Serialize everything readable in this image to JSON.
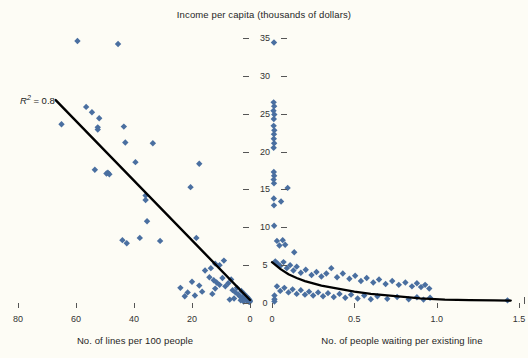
{
  "figure": {
    "title": "Income per capita (thousands of dollars)",
    "width": 528,
    "height": 358,
    "background_color": "#fdfcf5",
    "marker_color": "#4a6fa0",
    "trend_color": "#000000",
    "text_color": "#262626"
  },
  "annotations": {
    "r2_prefix": "R",
    "r2_sup": "2",
    "r2_value": " = 0.8"
  },
  "axis": {
    "shared_y": {
      "label": "Income per capita (thousands of dollars)",
      "ticks": [
        0,
        5,
        10,
        15,
        20,
        25,
        30,
        35
      ],
      "tick_labels": [
        "0",
        "5",
        "10",
        "15",
        "20",
        "25",
        "30",
        "35"
      ],
      "range": [
        0,
        36.5
      ]
    },
    "left_x": {
      "label": "No. of lines per 100 people",
      "ticks": [
        80,
        60,
        40,
        20,
        0
      ],
      "tick_labels": [
        "80",
        "60",
        "40",
        "20",
        "0"
      ],
      "range": [
        82,
        -2
      ],
      "reversed": true
    },
    "right_x": {
      "label": "No. of people waiting per existing line",
      "ticks": [
        0,
        0.5,
        1.0,
        1.5
      ],
      "tick_labels": [
        "0",
        "0.5",
        "1.0",
        "1.5"
      ],
      "range": [
        -0.02,
        1.53
      ]
    }
  },
  "chart_data": [
    {
      "type": "scatter",
      "id": "left-panel",
      "title": "Income per capita (thousands of dollars)",
      "xlabel": "No. of lines per 100 people",
      "ylabel": "Income per capita (thousands of dollars)",
      "xlim": [
        82,
        -2
      ],
      "ylim": [
        0,
        36.5
      ],
      "grid": false,
      "legend": "none",
      "annotation": "R2 = 0.8",
      "series": [
        {
          "name": "countries",
          "marker": "diamond",
          "color": "#4a6fa0",
          "points": [
            [
              59.5,
              34.6
            ],
            [
              45.5,
              34.2
            ],
            [
              56.5,
              25.9
            ],
            [
              54.5,
              25.2
            ],
            [
              52.0,
              24.4
            ],
            [
              52.5,
              23.2
            ],
            [
              52.5,
              22.9
            ],
            [
              65.0,
              23.6
            ],
            [
              43.5,
              23.3
            ],
            [
              43.0,
              21.2
            ],
            [
              33.5,
              21.1
            ],
            [
              39.5,
              18.6
            ],
            [
              53.5,
              17.6
            ],
            [
              49.0,
              17.2
            ],
            [
              49.5,
              17.1
            ],
            [
              48.5,
              17.0
            ],
            [
              17.5,
              18.4
            ],
            [
              20.5,
              15.3
            ],
            [
              36.0,
              14.2
            ],
            [
              36.0,
              13.6
            ],
            [
              35.5,
              10.8
            ],
            [
              44.0,
              8.3
            ],
            [
              42.5,
              7.9
            ],
            [
              38.0,
              8.6
            ],
            [
              31.0,
              8.2
            ],
            [
              18.5,
              8.6
            ],
            [
              24.0,
              2.0
            ],
            [
              21.5,
              1.4
            ],
            [
              15.5,
              4.3
            ],
            [
              13.5,
              4.6
            ],
            [
              12.0,
              5.2
            ],
            [
              10.5,
              5.0
            ],
            [
              9.0,
              5.6
            ],
            [
              14.0,
              3.4
            ],
            [
              12.5,
              3.0
            ],
            [
              11.5,
              2.7
            ],
            [
              10.5,
              2.4
            ],
            [
              9.5,
              3.3
            ],
            [
              8.5,
              2.2
            ],
            [
              7.5,
              2.6
            ],
            [
              6.5,
              3.1
            ],
            [
              6.0,
              1.7
            ],
            [
              5.0,
              1.4
            ],
            [
              4.5,
              2.0
            ],
            [
              4.0,
              1.1
            ],
            [
              3.5,
              0.9
            ],
            [
              3.0,
              1.6
            ],
            [
              2.5,
              0.7
            ],
            [
              2.0,
              1.2
            ],
            [
              1.8,
              0.5
            ],
            [
              1.5,
              0.9
            ],
            [
              1.2,
              0.4
            ],
            [
              1.0,
              0.8
            ],
            [
              0.8,
              0.3
            ],
            [
              0.6,
              0.6
            ],
            [
              0.5,
              0.2
            ],
            [
              0.4,
              0.5
            ],
            [
              0.3,
              0.3
            ],
            [
              0.2,
              0.4
            ],
            [
              0.15,
              0.2
            ],
            [
              0.1,
              0.3
            ],
            [
              0.05,
              0.15
            ],
            [
              2.2,
              0.2
            ],
            [
              3.2,
              0.35
            ],
            [
              5.5,
              0.6
            ],
            [
              7.0,
              0.45
            ],
            [
              12.0,
              1.9
            ],
            [
              13.0,
              1.2
            ],
            [
              16.5,
              1.5
            ],
            [
              17.5,
              2.3
            ],
            [
              19.0,
              1.0
            ],
            [
              20.0,
              2.8
            ],
            [
              22.5,
              0.9
            ]
          ]
        }
      ],
      "trendline": {
        "type": "linear",
        "x_start": 67.0,
        "y_start": 26.8,
        "x_end": 0.0,
        "y_end": 0.4
      }
    },
    {
      "type": "scatter",
      "id": "right-panel",
      "title": "Income per capita (thousands of dollars)",
      "xlabel": "No. of people waiting per existing line",
      "ylabel": "Income per capita (thousands of dollars)",
      "xlim": [
        -0.02,
        1.53
      ],
      "ylim": [
        0,
        36.5
      ],
      "grid": false,
      "legend": "none",
      "series": [
        {
          "name": "countries",
          "marker": "diamond",
          "color": "#4a6fa0",
          "points": [
            [
              0.012,
              34.4
            ],
            [
              0.01,
              26.5
            ],
            [
              0.013,
              26.0
            ],
            [
              0.009,
              25.4
            ],
            [
              0.014,
              24.9
            ],
            [
              0.011,
              24.3
            ],
            [
              0.01,
              23.4
            ],
            [
              0.014,
              22.8
            ],
            [
              0.012,
              22.3
            ],
            [
              0.011,
              21.7
            ],
            [
              0.013,
              21.1
            ],
            [
              0.01,
              20.5
            ],
            [
              0.011,
              17.3
            ],
            [
              0.013,
              16.8
            ],
            [
              0.01,
              16.3
            ],
            [
              0.012,
              15.8
            ],
            [
              0.011,
              13.8
            ],
            [
              0.012,
              12.9
            ],
            [
              0.013,
              10.2
            ],
            [
              0.095,
              15.2
            ],
            [
              0.055,
              13.4
            ],
            [
              0.03,
              8.2
            ],
            [
              0.045,
              7.6
            ],
            [
              0.065,
              8.3
            ],
            [
              0.08,
              7.7
            ],
            [
              0.135,
              6.7
            ],
            [
              0.02,
              5.5
            ],
            [
              0.035,
              5.2
            ],
            [
              0.05,
              4.9
            ],
            [
              0.07,
              5.4
            ],
            [
              0.09,
              4.6
            ],
            [
              0.11,
              5.0
            ],
            [
              0.13,
              4.3
            ],
            [
              0.15,
              4.8
            ],
            [
              0.175,
              4.0
            ],
            [
              0.205,
              4.4
            ],
            [
              0.24,
              3.7
            ],
            [
              0.27,
              4.1
            ],
            [
              0.3,
              3.5
            ],
            [
              0.33,
              3.9
            ],
            [
              0.36,
              4.6
            ],
            [
              0.395,
              3.4
            ],
            [
              0.43,
              3.9
            ],
            [
              0.47,
              3.2
            ],
            [
              0.505,
              3.6
            ],
            [
              0.54,
              2.9
            ],
            [
              0.575,
              3.3
            ],
            [
              0.615,
              2.7
            ],
            [
              0.65,
              3.1
            ],
            [
              0.69,
              2.5
            ],
            [
              0.73,
              2.9
            ],
            [
              0.77,
              2.4
            ],
            [
              0.81,
              2.7
            ],
            [
              0.85,
              2.2
            ],
            [
              0.88,
              2.6
            ],
            [
              0.905,
              2.1
            ],
            [
              0.93,
              2.4
            ],
            [
              0.955,
              1.9
            ],
            [
              0.03,
              2.2
            ],
            [
              0.05,
              1.6
            ],
            [
              0.075,
              2.0
            ],
            [
              0.1,
              1.4
            ],
            [
              0.125,
              1.8
            ],
            [
              0.15,
              1.2
            ],
            [
              0.175,
              1.7
            ],
            [
              0.2,
              1.1
            ],
            [
              0.225,
              1.5
            ],
            [
              0.25,
              1.0
            ],
            [
              0.28,
              1.4
            ],
            [
              0.31,
              0.9
            ],
            [
              0.34,
              1.3
            ],
            [
              0.375,
              0.8
            ],
            [
              0.41,
              1.2
            ],
            [
              0.445,
              0.7
            ],
            [
              0.48,
              1.1
            ],
            [
              0.52,
              0.6
            ],
            [
              0.56,
              1.0
            ],
            [
              0.6,
              0.5
            ],
            [
              0.015,
              1.0
            ],
            [
              0.015,
              0.5
            ],
            [
              0.015,
              0.2
            ],
            [
              0.64,
              0.9
            ],
            [
              0.7,
              0.55
            ],
            [
              0.76,
              0.8
            ],
            [
              0.83,
              0.5
            ],
            [
              0.88,
              0.75
            ],
            [
              0.92,
              0.45
            ],
            [
              0.96,
              0.7
            ],
            [
              1.43,
              0.35
            ]
          ]
        }
      ],
      "trendline": {
        "type": "exponential-decay",
        "points": [
          [
            0.0,
            5.4
          ],
          [
            0.05,
            4.5
          ],
          [
            0.1,
            3.8
          ],
          [
            0.15,
            3.3
          ],
          [
            0.2,
            2.9
          ],
          [
            0.3,
            2.3
          ],
          [
            0.4,
            1.9
          ],
          [
            0.5,
            1.5
          ],
          [
            0.6,
            1.2
          ],
          [
            0.75,
            0.9
          ],
          [
            0.9,
            0.6
          ],
          [
            1.05,
            0.45
          ],
          [
            1.2,
            0.38
          ],
          [
            1.35,
            0.34
          ],
          [
            1.45,
            0.32
          ]
        ]
      }
    }
  ]
}
